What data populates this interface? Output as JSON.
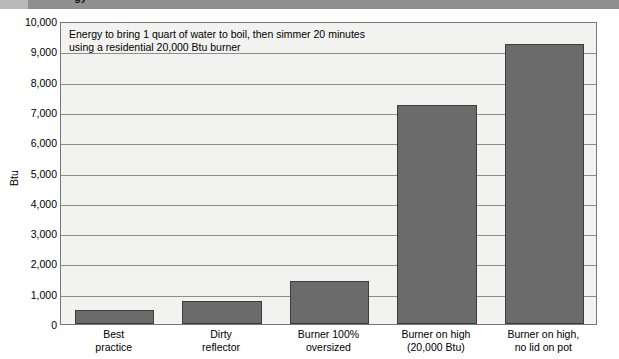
{
  "header": {
    "partial_title": "gy"
  },
  "chart_data": {
    "type": "bar",
    "title": "",
    "annotation": [
      "Energy to bring 1 quart of water to boil, then simmer 20 minutes",
      "using a residential 20,000 Btu burner"
    ],
    "categories": [
      "Best\npractice",
      "Dirty\nreflector",
      "Burner 100%\noversized",
      "Burner on high\n(20,000 Btu)",
      "Burner on high,\nno lid on pot"
    ],
    "category_lines": [
      [
        "Best",
        "practice"
      ],
      [
        "Dirty",
        "reflector"
      ],
      [
        "Burner 100%",
        "oversized"
      ],
      [
        "Burner on high",
        "(20,000 Btu)"
      ],
      [
        "Burner on high,",
        "no lid on pot"
      ]
    ],
    "values": [
      460,
      760,
      1420,
      7230,
      9250
    ],
    "xlabel": "",
    "ylabel": "Btu",
    "ylim": [
      0,
      10000
    ],
    "ytick_step": 1000,
    "yticks": [
      0,
      1000,
      2000,
      3000,
      4000,
      5000,
      6000,
      7000,
      8000,
      9000,
      10000
    ],
    "ytick_labels": [
      "0",
      "1,000",
      "2,000",
      "3,000",
      "4,000",
      "5,000",
      "6,000",
      "7,000",
      "8,000",
      "9,000",
      "10,000"
    ],
    "grid": true,
    "legend": null,
    "bar_color": "#6b6b6b",
    "bar_border_color": "#3c3c3c",
    "plot_background": "#f2f2f0"
  }
}
